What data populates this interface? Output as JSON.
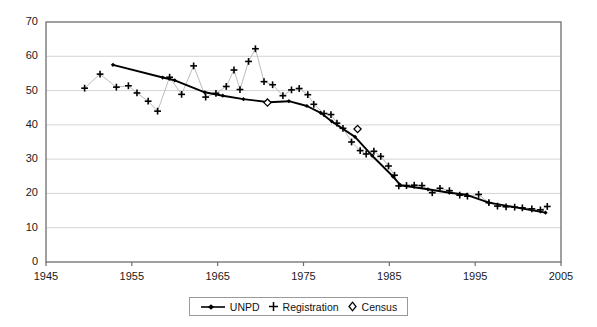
{
  "chart_data": {
    "type": "line",
    "title": "",
    "subtitle": "",
    "xlabel": "",
    "ylabel": "",
    "xlim": [
      1945,
      2005
    ],
    "ylim": [
      0,
      70
    ],
    "xticks": [
      1945,
      1955,
      1965,
      1975,
      1985,
      1995,
      2005
    ],
    "yticks": [
      0,
      10,
      20,
      30,
      40,
      50,
      60,
      70
    ],
    "grid": "horizontal",
    "legend_position": "bottom-center",
    "series": [
      {
        "name": "UNPD",
        "marker": "filled-diamond",
        "line": "solid-thick",
        "color": "#000000",
        "points": [
          [
            1952.8,
            57.5
          ],
          [
            1958.6,
            53.8
          ],
          [
            1960.0,
            53.0
          ],
          [
            1963.5,
            49.5
          ],
          [
            1965.6,
            48.5
          ],
          [
            1968.0,
            47.5
          ],
          [
            1971.0,
            46.6
          ],
          [
            1973.3,
            46.9
          ],
          [
            1975.4,
            45.5
          ],
          [
            1977.0,
            43.5
          ],
          [
            1978.3,
            41.0
          ],
          [
            1981.0,
            36.5
          ],
          [
            1983.0,
            31.0
          ],
          [
            1985.4,
            25.0
          ],
          [
            1986.3,
            22.4
          ],
          [
            1989.5,
            21.2
          ],
          [
            1992.0,
            20.2
          ],
          [
            1994.0,
            19.6
          ],
          [
            1996.6,
            17.3
          ],
          [
            2003.2,
            14.4
          ]
        ]
      },
      {
        "name": "Registration",
        "marker": "plus",
        "line": "thin-gray",
        "color": "#000000",
        "points": [
          [
            1949.5,
            50.7
          ],
          [
            1951.3,
            54.8
          ],
          [
            1953.2,
            51.0
          ],
          [
            1954.6,
            51.4
          ],
          [
            1955.6,
            49.3
          ],
          [
            1956.9,
            46.9
          ],
          [
            1958.0,
            44.0
          ],
          [
            1959.4,
            53.9
          ],
          [
            1960.8,
            48.9
          ],
          [
            1962.2,
            57.2
          ],
          [
            1963.6,
            48.1
          ],
          [
            1964.8,
            49.2
          ],
          [
            1966.0,
            51.2
          ],
          [
            1966.9,
            56.0
          ],
          [
            1967.6,
            50.3
          ],
          [
            1968.6,
            58.5
          ],
          [
            1969.4,
            62.2
          ],
          [
            1970.4,
            52.6
          ],
          [
            1971.4,
            51.7
          ],
          [
            1972.6,
            48.5
          ],
          [
            1973.6,
            50.2
          ],
          [
            1974.5,
            50.6
          ],
          [
            1975.5,
            48.8
          ],
          [
            1976.2,
            46.0
          ],
          [
            1977.4,
            43.3
          ],
          [
            1978.2,
            43.0
          ],
          [
            1978.9,
            40.5
          ],
          [
            1979.6,
            39.0
          ],
          [
            1980.6,
            35.0
          ],
          [
            1981.6,
            32.5
          ],
          [
            1982.3,
            31.5
          ],
          [
            1983.2,
            32.3
          ],
          [
            1984.0,
            30.8
          ],
          [
            1984.9,
            28.0
          ],
          [
            1985.6,
            25.3
          ],
          [
            1986.1,
            22.2
          ],
          [
            1987.0,
            22.3
          ],
          [
            1987.9,
            22.4
          ],
          [
            1988.8,
            22.3
          ],
          [
            1990.0,
            20.2
          ],
          [
            1990.9,
            21.5
          ],
          [
            1992.0,
            20.8
          ],
          [
            1993.2,
            19.5
          ],
          [
            1994.1,
            19.2
          ],
          [
            1995.4,
            19.7
          ],
          [
            1996.6,
            17.3
          ],
          [
            1997.6,
            16.3
          ],
          [
            1998.6,
            16.1
          ],
          [
            1999.6,
            16.0
          ],
          [
            2000.5,
            15.8
          ],
          [
            2001.6,
            15.5
          ],
          [
            2002.6,
            15.2
          ],
          [
            2003.4,
            16.2
          ]
        ]
      },
      {
        "name": "Census",
        "marker": "open-diamond",
        "line": "none",
        "color": "#000000",
        "points": [
          [
            1970.8,
            46.5
          ],
          [
            1981.3,
            38.8
          ]
        ]
      }
    ]
  },
  "legend": {
    "entries": [
      {
        "label": "UNPD",
        "marker": "line-with-dot"
      },
      {
        "label": "Registration",
        "marker": "plus"
      },
      {
        "label": "Census",
        "marker": "open-diamond"
      }
    ]
  },
  "axes": {
    "y_tick_labels": [
      "70",
      "60",
      "50",
      "40",
      "30",
      "20",
      "10",
      "0"
    ],
    "x_tick_labels": [
      "1945",
      "1955",
      "1965",
      "1975",
      "1985",
      "1995",
      "2005"
    ]
  }
}
